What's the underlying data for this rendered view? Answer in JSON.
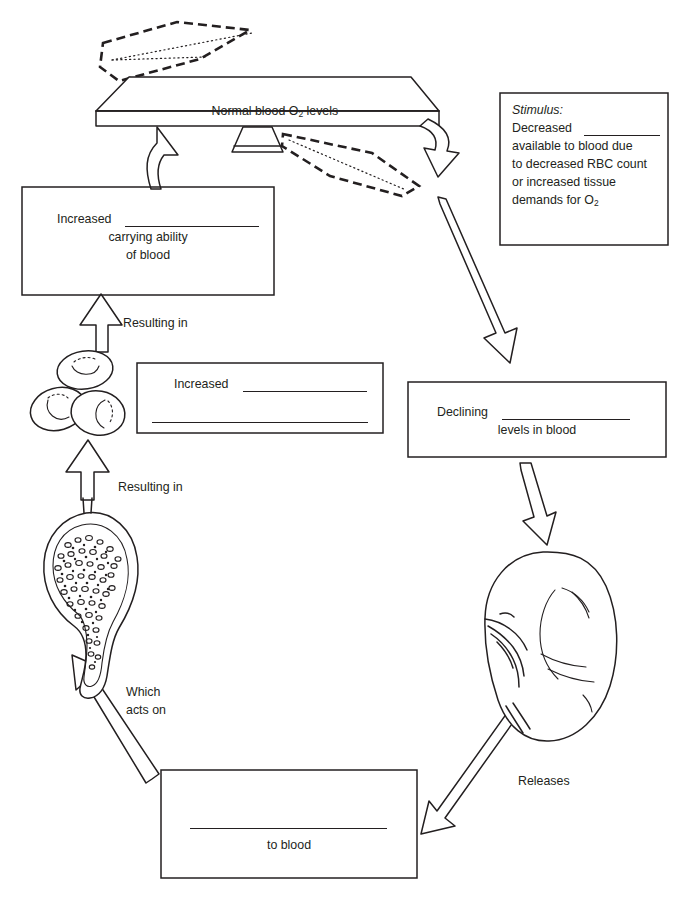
{
  "diagram": {
    "balance": {
      "label_prefix": "Normal blood O",
      "label_sub": "2",
      "label_suffix": " levels",
      "full_label": "Normal blood O2 levels",
      "name": "balance-beam"
    },
    "stimulus_box": {
      "heading": "Stimulus:",
      "lines": [
        "Decreased ________",
        "available to blood due",
        "to decreased RBC count",
        "or increased tissue",
        "demands for O2"
      ],
      "line1_prefix": "Decreased ",
      "line2": "available to blood due",
      "line3": "to decreased RBC count",
      "line4": "or increased tissue",
      "line5_prefix": "demands for O",
      "line5_sub": "2"
    },
    "increased_carrying_box": {
      "line1_prefix": "Increased ",
      "line2": "carrying ability",
      "line3": "of blood"
    },
    "increased_blank_box": {
      "line1_prefix": "Increased ",
      "line2": ""
    },
    "declining_box": {
      "line1_prefix": "Declining ",
      "line2": "levels in blood"
    },
    "to_blood_box": {
      "line1": "",
      "line2": "to blood"
    },
    "connector_labels": [
      {
        "id": "resulting-in-upper",
        "text": "Resulting in"
      },
      {
        "id": "resulting-in-lower",
        "text": "Resulting in"
      },
      {
        "id": "which-acts-on-line1",
        "text": "Which"
      },
      {
        "id": "which-acts-on-line2",
        "text": "acts on"
      },
      {
        "id": "releases",
        "text": "Releases"
      }
    ],
    "illustrations": [
      {
        "id": "red-blood-cells",
        "name": "red-blood-cells-illustration"
      },
      {
        "id": "bone-marrow",
        "name": "bone-marrow-illustration"
      },
      {
        "id": "kidney",
        "name": "kidney-illustration"
      }
    ],
    "colors": {
      "ink": "#231f20",
      "paper": "#ffffff"
    }
  }
}
